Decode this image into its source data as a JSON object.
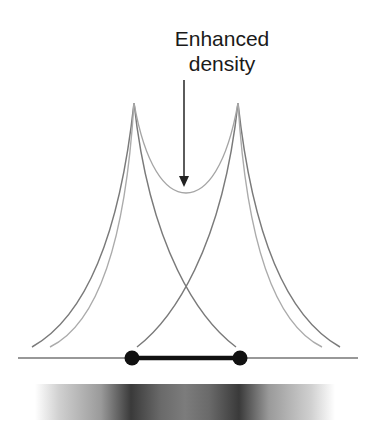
{
  "annotation": {
    "line1": "Enhanced",
    "line2": "density"
  },
  "colors": {
    "dark_curve": "#777777",
    "light_curve": "#aaaaaa",
    "axis": "#333333",
    "bar": "#111111"
  },
  "diagram": {
    "peaks_x": [
      134,
      238
    ],
    "peak_y": 103,
    "baseline_y": 358,
    "dots_x": [
      132,
      240
    ],
    "crossing": [
      186,
      281
    ],
    "sum_minimum_y": 193
  }
}
